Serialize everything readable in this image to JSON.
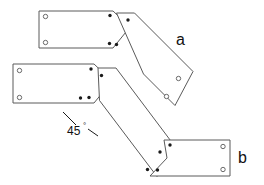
{
  "figure": {
    "type": "engineering-line-drawing",
    "background_color": "#ffffff",
    "line_color": "#5a5a5a",
    "text_color": "#111111",
    "filled_hole_color": "#1a1a1a",
    "width": 264,
    "height": 185
  },
  "labels": {
    "plate_a": "a",
    "plate_b": "b",
    "angle_value": "45",
    "angle_degree_symbol": "°"
  },
  "plates": [
    {
      "id": "plate-top-left",
      "orientation": "horizontal",
      "points": "39,11 113,11 130,27 113,48 39,48",
      "holes_open": [
        {
          "cx": 45.5,
          "cy": 16.5,
          "r": 2.2
        },
        {
          "cx": 45.5,
          "cy": 42.5,
          "r": 2.2
        }
      ],
      "holes_filled": [
        {
          "cx": 110,
          "cy": 15.5,
          "r": 1.7
        },
        {
          "cx": 109.5,
          "cy": 43.5,
          "r": 1.7
        }
      ]
    },
    {
      "id": "plate-a-diagonal",
      "orientation": "diagonal-down-right",
      "points": "116.5,13 134.5,13 193,71.5 175,105.5 143.5,74",
      "holes_open": [
        {
          "cx": 178.5,
          "cy": 78.5,
          "r": 2.2
        },
        {
          "cx": 166.5,
          "cy": 96.5,
          "r": 2.2
        }
      ],
      "holes_filled": [
        {
          "cx": 128,
          "cy": 20,
          "r": 1.7
        },
        {
          "cx": 116.5,
          "cy": 44.5,
          "r": 1.7
        }
      ]
    },
    {
      "id": "plate-middle-left",
      "orientation": "horizontal",
      "points": "13,64 94,64 112,81 94,103 13,103",
      "holes_open": [
        {
          "cx": 19.5,
          "cy": 70.5,
          "r": 2.2
        },
        {
          "cx": 19.5,
          "cy": 97.5,
          "r": 2.2
        }
      ],
      "holes_filled": [
        {
          "cx": 91,
          "cy": 69,
          "r": 1.7
        },
        {
          "cx": 80.5,
          "cy": 98,
          "r": 1.7
        }
      ]
    },
    {
      "id": "plate-b-diagonal",
      "orientation": "diagonal-down-right",
      "points": "98,68 116,68 175,146.5 157,176.5 99.5,100.5",
      "holes_open": [],
      "holes_filled": [
        {
          "cx": 101.5,
          "cy": 75.5,
          "r": 1.7
        },
        {
          "cx": 89,
          "cy": 97.5,
          "r": 1.7
        },
        {
          "cx": 160,
          "cy": 152,
          "r": 1.7
        },
        {
          "cx": 147.5,
          "cy": 169.5,
          "r": 1.7
        }
      ]
    },
    {
      "id": "plate-bottom-right",
      "orientation": "horizontal",
      "points": "164,140 230,140 230,176 150,176 167,158",
      "holes_open": [
        {
          "cx": 223,
          "cy": 146.5,
          "r": 2.2
        },
        {
          "cx": 223,
          "cy": 169.5,
          "r": 2.2
        }
      ],
      "holes_filled": [
        {
          "cx": 170,
          "cy": 145,
          "r": 1.7
        },
        {
          "cx": 157.5,
          "cy": 170,
          "r": 1.7
        }
      ]
    }
  ],
  "annotations": {
    "angle_leader_upper": "M 63,112 L 76,125",
    "angle_leader_lower": "M 88,129 L 98,136",
    "angle_text_x": 67,
    "angle_text_y": 135,
    "label_a_x": 176,
    "label_a_y": 45,
    "label_b_x": 238,
    "label_b_y": 163
  }
}
